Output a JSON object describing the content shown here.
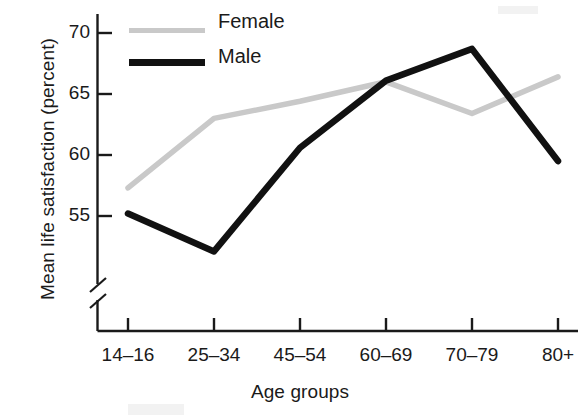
{
  "chart_data": {
    "type": "line",
    "title": "",
    "xlabel": "Age groups",
    "ylabel": "Mean life satisfaction (percent)",
    "categories": [
      "14–16",
      "25–34",
      "45–54",
      "60–69",
      "70–79",
      "80+"
    ],
    "ylim": [
      50.5,
      71.5
    ],
    "y_ticks": [
      55,
      60,
      65,
      70
    ],
    "y_tick_labels": [
      "55",
      "60",
      "65",
      "70"
    ],
    "y_axis_break": true,
    "grid": false,
    "legend_position": "top-left-inside",
    "series": [
      {
        "name": "Female",
        "color": "#c9c9c9",
        "values": [
          57.3,
          63.0,
          64.4,
          66.0,
          63.4,
          66.4
        ]
      },
      {
        "name": "Male",
        "color": "#111111",
        "values": [
          55.2,
          52.1,
          60.6,
          66.1,
          68.7,
          59.5
        ]
      }
    ]
  },
  "legend": {
    "items": [
      {
        "label": "Female",
        "swatch_color": "#c9c9c9"
      },
      {
        "label": "Male",
        "swatch_color": "#111111"
      }
    ]
  },
  "axes": {
    "y_title": "Mean life satisfaction (percent)",
    "x_title": "Age groups",
    "y_tick_labels": [
      "70",
      "65",
      "60",
      "55"
    ],
    "x_tick_labels": [
      "14–16",
      "25–34",
      "45–54",
      "60–69",
      "70–79",
      "80+"
    ]
  },
  "colors": {
    "female_line": "#c9c9c9",
    "male_line": "#111111",
    "axis": "#1a1a1a",
    "background": "#ffffff"
  }
}
